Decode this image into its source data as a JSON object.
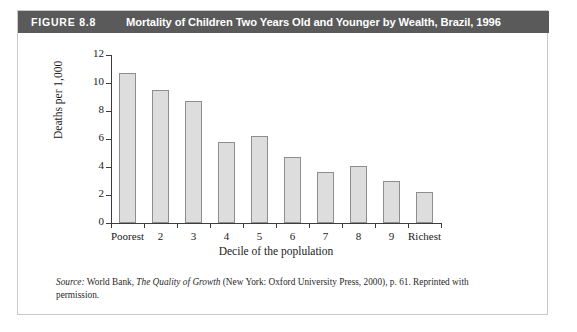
{
  "figure": {
    "number_label": "FIGURE 8.8",
    "title": "Mortality of Children Two Years Old and Younger by Wealth, Brazil, 1996",
    "header_bg": "#5a5a5a",
    "header_text_color": "#ffffff"
  },
  "source": {
    "label": "Source:",
    "text_before_italic": " World Bank, ",
    "italic_title": "The Quality of Growth",
    "text_after_italic": " (New York: Oxford University Press, 2000), p. 61. Reprinted with permission."
  },
  "chart_data": {
    "type": "bar",
    "title": "Mortality of Children Two Years Old and Younger by Wealth, Brazil, 1996",
    "xlabel": "Decile of the poplulation",
    "ylabel": "Deaths per 1,000",
    "categories": [
      "Poorest",
      "2",
      "3",
      "4",
      "5",
      "6",
      "7",
      "8",
      "9",
      "Richest"
    ],
    "values": [
      10.7,
      9.5,
      8.7,
      5.8,
      6.2,
      4.7,
      3.65,
      4.1,
      3.0,
      2.2
    ],
    "ylim": [
      0,
      12
    ],
    "yticks": [
      0,
      2,
      4,
      6,
      8,
      10,
      12
    ],
    "ytick_labels": [
      "0",
      "2",
      "4",
      "6",
      "8",
      "10",
      "12"
    ],
    "grid": false,
    "legend": null,
    "bar_fill": "#dddddd",
    "bar_border": "#8e8e8e",
    "axis_color": "#3c3c3c"
  }
}
